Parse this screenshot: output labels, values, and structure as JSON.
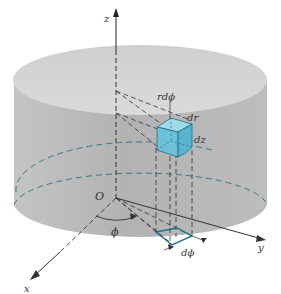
{
  "figure": {
    "labels": {
      "z_axis": "z",
      "x_axis": "x",
      "y_axis": "y",
      "origin": "O",
      "phi": "ϕ",
      "r_dphi": "rdϕ",
      "dr": "dr",
      "dz": "dz",
      "dphi": "dϕ"
    },
    "colors": {
      "cylinder_fill": "#b8b8b8",
      "cylinder_top": "#d2d2d2",
      "element_fill": "#6fc3dc",
      "element_stroke": "#1f6f86",
      "lines": "#333333"
    }
  }
}
